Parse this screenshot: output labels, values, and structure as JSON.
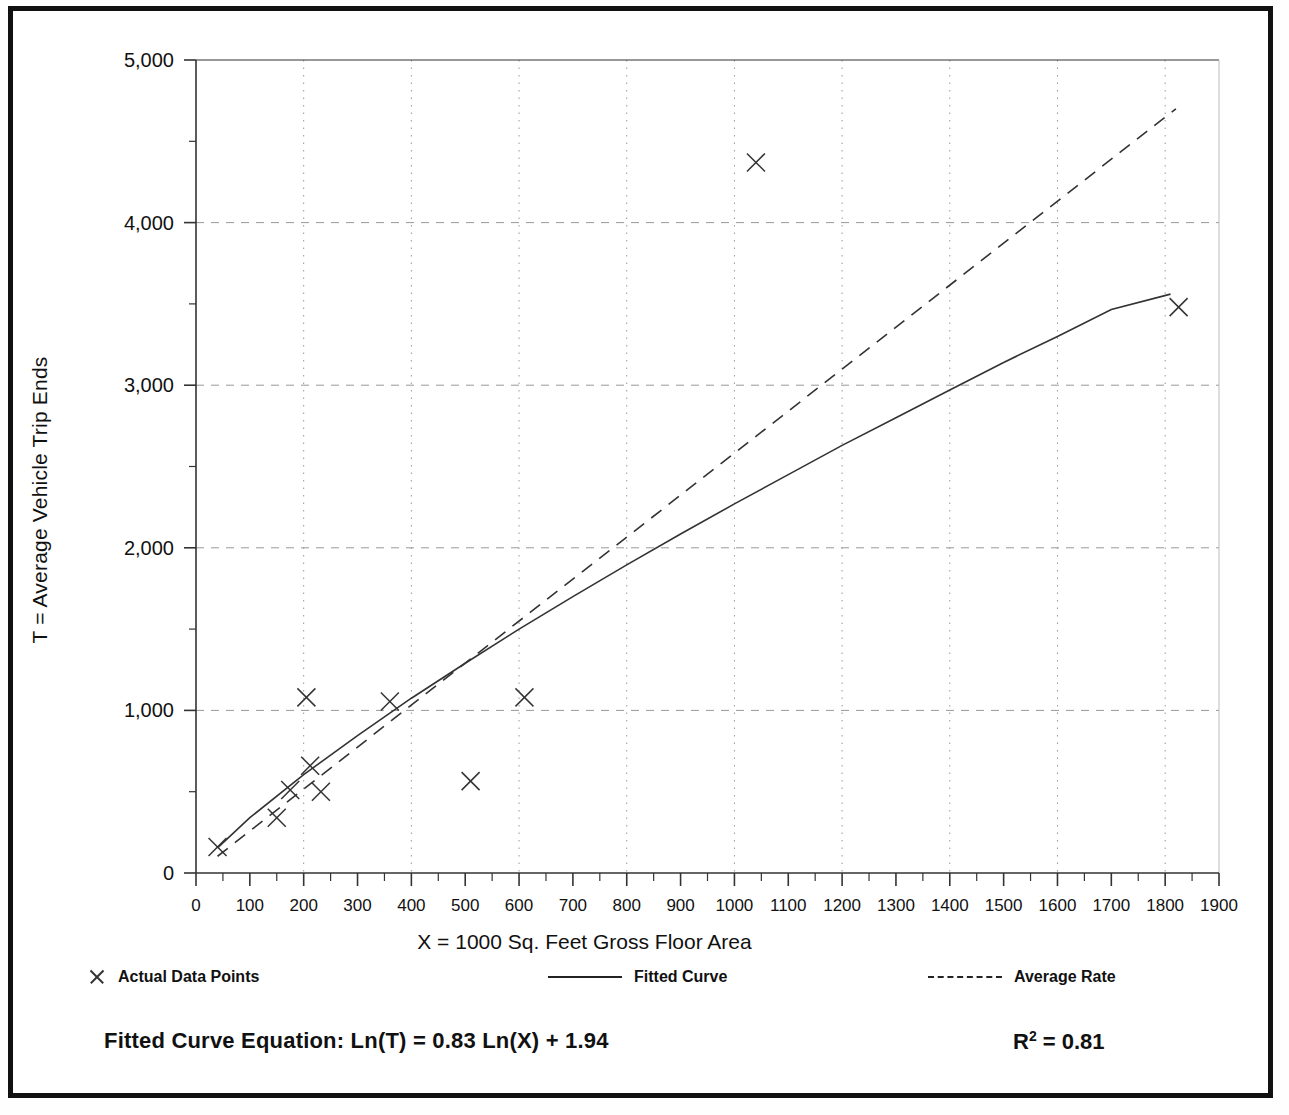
{
  "chart_data": {
    "type": "scatter",
    "title": "",
    "xlabel": "X = 1000 Sq. Feet Gross Floor Area",
    "ylabel": "T = Average Vehicle Trip Ends",
    "xlim": [
      0,
      1900
    ],
    "ylim": [
      0,
      5000
    ],
    "xticks": [
      0,
      100,
      200,
      300,
      400,
      500,
      600,
      700,
      800,
      900,
      1000,
      1100,
      1200,
      1300,
      1400,
      1500,
      1600,
      1700,
      1800,
      1900
    ],
    "xtick_labels": [
      "0",
      "100",
      "200",
      "300",
      "400",
      "500",
      "600",
      "700",
      "800",
      "900",
      "1000",
      "1100",
      "1200",
      "1300",
      "1400",
      "1500",
      "1600",
      "1700",
      "1800",
      "1900"
    ],
    "xminor_step": 50,
    "yticks": [
      0,
      1000,
      2000,
      3000,
      4000,
      5000
    ],
    "ytick_labels": [
      "0",
      "1,000",
      "2,000",
      "3,000",
      "4,000",
      "5,000"
    ],
    "yminor_step": 500,
    "grid": true,
    "grid_style": "dotted",
    "grid_x_step": 200,
    "grid_y_step": 1000,
    "legend_position": "below-axis",
    "series": [
      {
        "name": "Actual Data Points",
        "type": "scatter",
        "marker": "x",
        "points": [
          {
            "x": 40,
            "y": 160
          },
          {
            "x": 150,
            "y": 340
          },
          {
            "x": 175,
            "y": 510
          },
          {
            "x": 205,
            "y": 1080
          },
          {
            "x": 212,
            "y": 660
          },
          {
            "x": 232,
            "y": 500
          },
          {
            "x": 360,
            "y": 1055
          },
          {
            "x": 510,
            "y": 565
          },
          {
            "x": 610,
            "y": 1080
          },
          {
            "x": 1040,
            "y": 4370
          },
          {
            "x": 1825,
            "y": 3480
          }
        ]
      },
      {
        "name": "Fitted Curve",
        "type": "line",
        "style": "solid",
        "equation": "Ln(T) = 0.83 Ln(X) + 1.94",
        "points": [
          {
            "x": 40,
            "y": 155
          },
          {
            "x": 100,
            "y": 340
          },
          {
            "x": 200,
            "y": 605
          },
          {
            "x": 300,
            "y": 845
          },
          {
            "x": 400,
            "y": 1075
          },
          {
            "x": 500,
            "y": 1290
          },
          {
            "x": 600,
            "y": 1500
          },
          {
            "x": 700,
            "y": 1700
          },
          {
            "x": 800,
            "y": 1895
          },
          {
            "x": 900,
            "y": 2085
          },
          {
            "x": 1000,
            "y": 2270
          },
          {
            "x": 1100,
            "y": 2450
          },
          {
            "x": 1200,
            "y": 2630
          },
          {
            "x": 1300,
            "y": 2800
          },
          {
            "x": 1400,
            "y": 2970
          },
          {
            "x": 1500,
            "y": 3140
          },
          {
            "x": 1600,
            "y": 3300
          },
          {
            "x": 1700,
            "y": 3465
          },
          {
            "x": 1810,
            "y": 3560
          }
        ]
      },
      {
        "name": "Average Rate",
        "type": "line",
        "style": "dashed",
        "points": [
          {
            "x": 40,
            "y": 103
          },
          {
            "x": 1820,
            "y": 4700
          }
        ]
      }
    ],
    "annotations": [
      {
        "name": "fitted-curve-equation",
        "text": "Fitted Curve Equation:  Ln(T) = 0.83 Ln(X) + 1.94"
      },
      {
        "name": "r-squared",
        "text": "R2 = 0.81",
        "value": 0.81
      }
    ]
  },
  "legend": {
    "items": [
      {
        "label": "Actual Data Points",
        "marker": "x-marker-icon"
      },
      {
        "label": "Fitted Curve",
        "marker": "solid-line-icon"
      },
      {
        "label": "Average Rate",
        "marker": "dashed-line-icon"
      }
    ]
  },
  "footer": {
    "equation_label": "Fitted Curve Equation:  Ln(T) = 0.83 Ln(X) + 1.94",
    "r2_prefix": "R",
    "r2_sup": "2",
    "r2_value": " = 0.81"
  },
  "colors": {
    "frame": "#111111",
    "axis": "#333333",
    "grid": "#999999",
    "data": "#333333",
    "text": "#111111"
  }
}
